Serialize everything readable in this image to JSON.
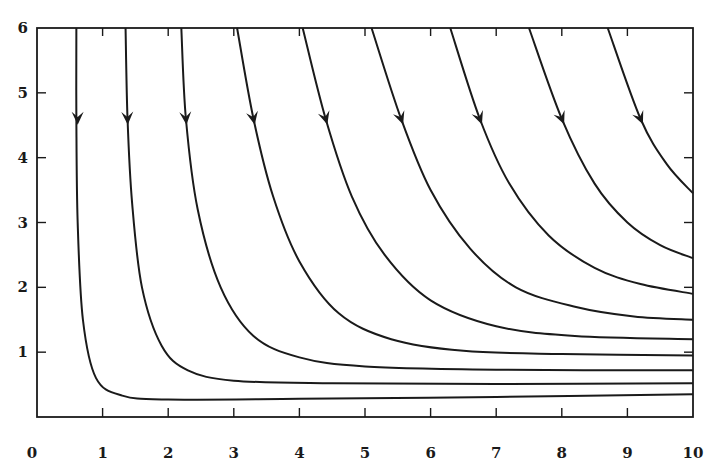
{
  "chart_data": {
    "type": "line",
    "title": "",
    "xlabel": "",
    "ylabel": "",
    "xlim": [
      0,
      10
    ],
    "ylim": [
      0,
      6
    ],
    "grid": false,
    "legend": null,
    "x_ticks": [
      "0",
      "1",
      "2",
      "3",
      "4",
      "5",
      "6",
      "7",
      "8",
      "9",
      "10"
    ],
    "y_ticks": [
      "1",
      "2",
      "3",
      "4",
      "5",
      "6"
    ],
    "annotations": "Each trajectory has a downward-pointing arrowhead near y ≈ 4.6 indicating direction of flow",
    "series": [
      {
        "name": "trajectory-1",
        "x": [
          0.6,
          0.6,
          0.62,
          0.7,
          0.9,
          1.3,
          2.0,
          4.0,
          7.0,
          10.0
        ],
        "y": [
          6.0,
          4.6,
          3.0,
          1.5,
          0.6,
          0.33,
          0.27,
          0.28,
          0.31,
          0.35
        ],
        "arrow_at": [
          0.62,
          4.6
        ]
      },
      {
        "name": "trajectory-2",
        "x": [
          1.35,
          1.38,
          1.45,
          1.6,
          1.9,
          2.3,
          3.0,
          4.5,
          7.0,
          10.0
        ],
        "y": [
          6.0,
          4.6,
          3.3,
          2.0,
          1.1,
          0.72,
          0.56,
          0.52,
          0.51,
          0.52
        ],
        "arrow_at": [
          1.38,
          4.6
        ]
      },
      {
        "name": "trajectory-3",
        "x": [
          2.2,
          2.27,
          2.45,
          2.8,
          3.3,
          4.0,
          5.0,
          7.0,
          10.0
        ],
        "y": [
          6.0,
          4.6,
          3.2,
          2.0,
          1.25,
          0.92,
          0.78,
          0.73,
          0.72
        ],
        "arrow_at": [
          2.27,
          4.6
        ]
      },
      {
        "name": "trajectory-4",
        "x": [
          3.05,
          3.3,
          3.6,
          4.0,
          4.6,
          5.4,
          6.5,
          8.0,
          10.0
        ],
        "y": [
          6.0,
          4.6,
          3.4,
          2.4,
          1.6,
          1.2,
          1.02,
          0.97,
          0.95
        ],
        "arrow_at": [
          3.3,
          4.6
        ]
      },
      {
        "name": "trajectory-5",
        "x": [
          4.05,
          4.4,
          4.8,
          5.3,
          6.0,
          7.0,
          8.2,
          10.0
        ],
        "y": [
          6.0,
          4.6,
          3.4,
          2.5,
          1.8,
          1.4,
          1.25,
          1.2
        ],
        "arrow_at": [
          4.4,
          4.6
        ]
      },
      {
        "name": "trajectory-6",
        "x": [
          5.1,
          5.55,
          6.0,
          6.6,
          7.3,
          8.2,
          9.1,
          10.0
        ],
        "y": [
          6.0,
          4.6,
          3.5,
          2.6,
          2.0,
          1.7,
          1.55,
          1.5
        ],
        "arrow_at": [
          5.55,
          4.6
        ]
      },
      {
        "name": "trajectory-7",
        "x": [
          6.3,
          6.75,
          7.2,
          7.8,
          8.5,
          9.2,
          10.0
        ],
        "y": [
          6.0,
          4.6,
          3.6,
          2.8,
          2.3,
          2.05,
          1.9
        ],
        "arrow_at": [
          6.75,
          4.6
        ]
      },
      {
        "name": "trajectory-8",
        "x": [
          7.5,
          8.0,
          8.5,
          9.0,
          9.5,
          10.0
        ],
        "y": [
          6.0,
          4.6,
          3.6,
          3.0,
          2.65,
          2.45
        ],
        "arrow_at": [
          8.0,
          4.6
        ]
      },
      {
        "name": "trajectory-9",
        "x": [
          8.7,
          9.2,
          9.6,
          10.0
        ],
        "y": [
          6.0,
          4.6,
          3.9,
          3.45
        ],
        "arrow_at": [
          9.2,
          4.6
        ]
      }
    ]
  },
  "axes": {
    "x_tick_labels": [
      "0",
      "1",
      "2",
      "3",
      "4",
      "5",
      "6",
      "7",
      "8",
      "9",
      "10"
    ],
    "y_tick_labels": [
      "1",
      "2",
      "3",
      "4",
      "5",
      "6"
    ]
  }
}
